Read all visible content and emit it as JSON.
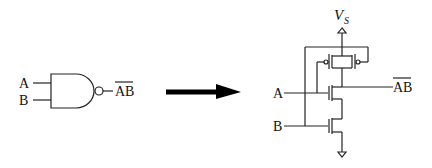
{
  "diagram": {
    "gate": {
      "type": "NAND",
      "inputs": [
        "A",
        "B"
      ],
      "output_label": "AB",
      "output_overline": true
    },
    "arrow": {
      "direction": "right"
    },
    "circuit": {
      "type": "CMOS NAND",
      "supply_label": "V",
      "supply_subscript": "S",
      "inputs": [
        "A",
        "B"
      ],
      "output_label": "AB",
      "output_overline": true,
      "pmos_count": 2,
      "nmos_count": 2,
      "pmos_arrangement": "parallel",
      "nmos_arrangement": "series",
      "ground": true
    }
  }
}
